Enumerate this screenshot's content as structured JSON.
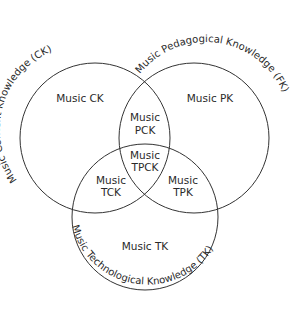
{
  "diagram": {
    "type": "venn",
    "colors": {
      "stroke": "#333333",
      "text": "#2a2a2a",
      "background": "#ffffff"
    },
    "circles": [
      {
        "id": "ck",
        "label": "Music Content Knowledge (CK)"
      },
      {
        "id": "pk",
        "label": "Music Pedagogical Knowledge (FK)"
      },
      {
        "id": "tk",
        "label": "Music Technological Knowledge (TK)"
      }
    ],
    "regions": {
      "ck": "Music CK",
      "pk": "Music PK",
      "pck": {
        "line1": "Music",
        "line2": "PCK"
      },
      "tpck": {
        "line1": "Music",
        "line2": "TPCK"
      },
      "tck": {
        "line1": "Music",
        "line2": "TCK"
      },
      "tpk": {
        "line1": "Music",
        "line2": "TPK"
      },
      "tk": "Music TK"
    }
  }
}
